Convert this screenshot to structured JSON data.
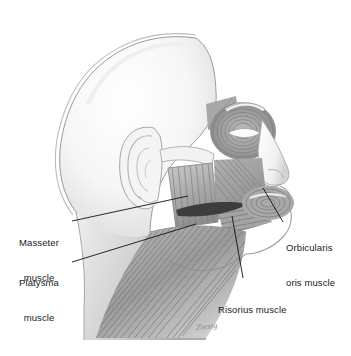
{
  "figure": {
    "view": "left lateral profile, facing right",
    "style": "grayscale pencil/airbrush medical illustration",
    "background_color": "#ffffff",
    "line_color": "#111111",
    "signature": "Ziesig"
  },
  "labels": [
    {
      "id": "masseter",
      "line1": "Masseter",
      "line2": "muscle",
      "align": "center",
      "text_x": 8,
      "text_y": 214,
      "text_w": 62,
      "leader": {
        "x1": 72,
        "y1": 221,
        "x2": 188,
        "y2": 196
      }
    },
    {
      "id": "platysma",
      "line1": "Platysma",
      "line2": "muscle",
      "align": "center",
      "text_x": 8,
      "text_y": 254,
      "text_w": 62,
      "leader": {
        "x1": 72,
        "y1": 262,
        "x2": 196,
        "y2": 224
      }
    },
    {
      "id": "orbicularis-oris",
      "line1": "Orbicularis",
      "line2": "oris muscle",
      "align": "left",
      "text_x": 285,
      "text_y": 219,
      "text_w": 62,
      "leader": {
        "x1": 283,
        "y1": 222,
        "x2": 263,
        "y2": 188
      }
    },
    {
      "id": "risorius",
      "line1": "Risorius muscle",
      "line2": "",
      "align": "left",
      "text_x": 218,
      "text_y": 281,
      "text_w": 96,
      "leader": {
        "x1": 243,
        "y1": 278,
        "x2": 232,
        "y2": 216
      }
    }
  ],
  "anatomy": {
    "regions": [
      "cranium",
      "ear (auricle)",
      "zygomatic arch",
      "orbicularis oculi",
      "orbicularis oris",
      "masseter muscle",
      "risorius muscle",
      "platysma muscle",
      "nose",
      "lips",
      "chin",
      "neck"
    ]
  },
  "palette": {
    "skull_light": "#f7f7f7",
    "skull_shadow": "#d9d9d9",
    "outline": "#8c8c8c",
    "muscle_light": "#c4c4c4",
    "muscle_mid": "#a0a0a0",
    "muscle_dark": "#6e6e6e",
    "muscle_darkest": "#3d3d3d",
    "fiber": "#7a7a7a",
    "leader": "#111111",
    "text": "#1a1a1a"
  }
}
